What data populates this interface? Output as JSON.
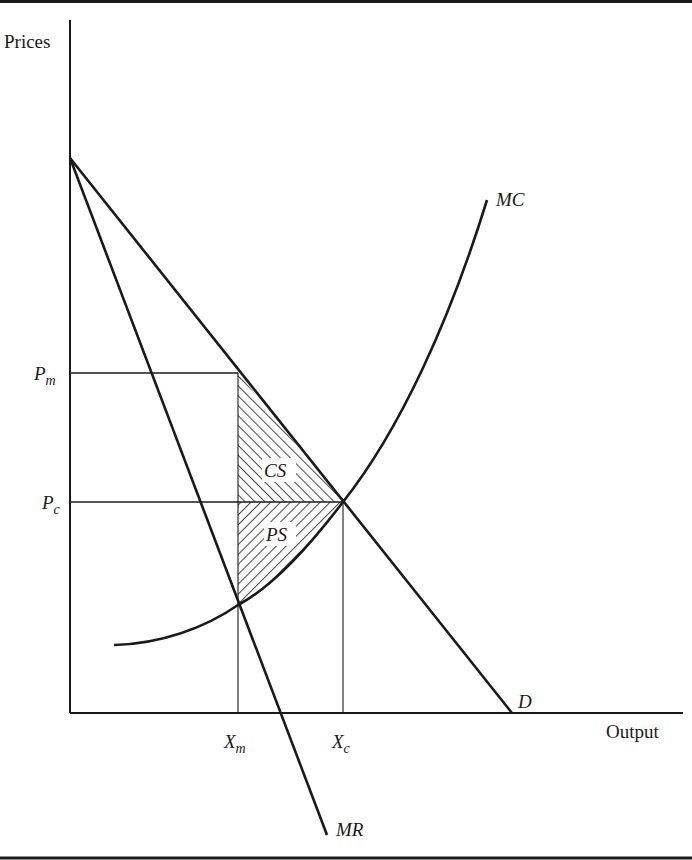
{
  "diagram": {
    "axes": {
      "y_label": "Prices",
      "x_label": "Output"
    },
    "price_ticks": [
      {
        "main": "P",
        "sub": "m"
      },
      {
        "main": "P",
        "sub": "c"
      }
    ],
    "quantity_ticks": [
      {
        "main": "X",
        "sub": "m"
      },
      {
        "main": "X",
        "sub": "c"
      }
    ],
    "curves": {
      "mc": "MC",
      "demand": "D",
      "mr": "MR"
    },
    "regions": {
      "consumer_surplus": "CS",
      "producer_surplus": "PS"
    },
    "colors": {
      "ink": "#1a1a1a",
      "background": "#ffffff"
    }
  }
}
